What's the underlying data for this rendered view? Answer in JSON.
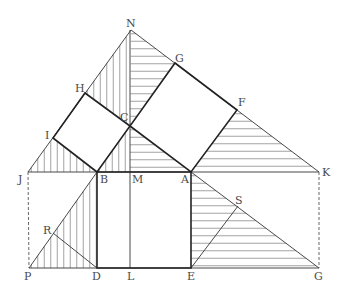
{
  "figure": {
    "labels": {
      "N": "N",
      "G_top": "G",
      "F": "F",
      "H": "H",
      "C": "C",
      "I": "I",
      "J": "J",
      "B": "B",
      "M": "M",
      "A": "A",
      "K": "K",
      "S": "S",
      "R": "R",
      "P": "P",
      "D": "D",
      "L": "L",
      "E": "E",
      "G_bottom": "G"
    }
  }
}
